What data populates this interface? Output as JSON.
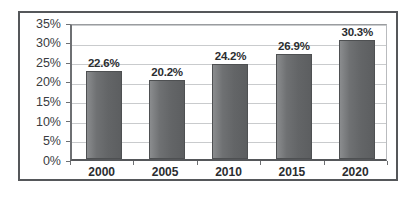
{
  "chart_data": {
    "type": "bar",
    "title": "",
    "subtitle": "",
    "xlabel": "",
    "ylabel": "",
    "categories": [
      "2000",
      "2005",
      "2010",
      "2015",
      "2020"
    ],
    "values": [
      22.6,
      20.2,
      24.2,
      26.9,
      30.3
    ],
    "value_labels": [
      "22.6%",
      "20.2%",
      "24.2%",
      "26.9%",
      "30.3%"
    ],
    "ylim": [
      0,
      35
    ],
    "ytick_values": [
      0,
      5,
      10,
      15,
      20,
      25,
      30,
      35
    ],
    "ytick_labels": [
      "0%",
      "5%",
      "10%",
      "15%",
      "20%",
      "25%",
      "30%",
      "35%"
    ],
    "grid": true,
    "grid_axis": "y",
    "legend": false,
    "legend_position": "none",
    "series": [
      {
        "name": "",
        "values": [
          22.6,
          20.2,
          24.2,
          26.9,
          30.3
        ]
      }
    ],
    "annotations": []
  },
  "style": {
    "bar_color": "#6f7173",
    "bar_edge_color": "#4e5052",
    "grid_color": "#c9cbcd",
    "axis_color": "#55575a",
    "frame_color": "#55575a",
    "label_color": "#2b2d30",
    "tick_label_color": "#3a3c3f",
    "plot_background": "#ffffff",
    "page_background": "#ffffff"
  }
}
